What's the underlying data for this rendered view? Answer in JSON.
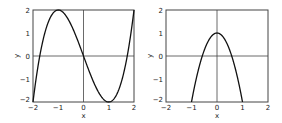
{
  "chart_data": [
    {
      "type": "line",
      "title": "",
      "xlabel": "x",
      "ylabel": "y",
      "xlim": [
        -2,
        2
      ],
      "ylim": [
        -2,
        2
      ],
      "xticks": [
        "-2",
        "-1",
        "0",
        "1",
        "2"
      ],
      "yticks": [
        "-2",
        "-1",
        "0",
        "1",
        "2"
      ],
      "grid": false,
      "axes_lines": true,
      "function": "y = x^3 - 3x",
      "series": [
        {
          "name": "f(x)",
          "x": [
            -2,
            -1.5,
            -1,
            -0.5,
            0,
            0.5,
            1,
            1.5,
            2
          ],
          "values": [
            -2,
            1.125,
            2,
            1.375,
            0,
            -1.375,
            -2,
            -1.125,
            2
          ]
        }
      ]
    },
    {
      "type": "line",
      "title": "",
      "xlabel": "x",
      "ylabel": "y",
      "xlim": [
        -2,
        2
      ],
      "ylim": [
        -2,
        2
      ],
      "xticks": [
        "-2",
        "-1",
        "0",
        "1",
        "2"
      ],
      "yticks": [
        "-2",
        "-1",
        "0",
        "1",
        "2"
      ],
      "grid": false,
      "axes_lines": true,
      "function": "y = 1 - 3x^2",
      "series": [
        {
          "name": "g(x)",
          "x": [
            -1,
            -0.5,
            0,
            0.5,
            1
          ],
          "values": [
            -2,
            0.25,
            1,
            0.25,
            -2
          ]
        }
      ]
    }
  ],
  "plots": [
    {
      "xlabel": "x",
      "ylabel": "y",
      "xticks": [
        "-2",
        "-1",
        "0",
        "1",
        "2"
      ],
      "yticks": [
        "2",
        "1",
        "0",
        "-1",
        "-2"
      ]
    },
    {
      "xlabel": "x",
      "ylabel": "y",
      "xticks": [
        "-2",
        "-1",
        "0",
        "1",
        "2"
      ],
      "yticks": [
        "2",
        "1",
        "0",
        "-1",
        "-2"
      ]
    }
  ]
}
